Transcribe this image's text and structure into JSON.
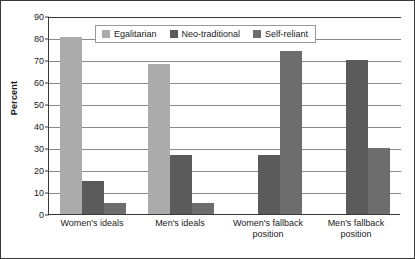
{
  "chart_data": {
    "type": "bar",
    "title": "",
    "xlabel": "",
    "ylabel": "Percent",
    "ylim": [
      0,
      90
    ],
    "yticks": [
      0,
      10,
      20,
      30,
      40,
      50,
      60,
      70,
      80,
      90
    ],
    "grid": true,
    "legend_position": "top-center-inside",
    "categories": [
      "Women's ideals",
      "Men's ideals",
      "Women's fallback position",
      "Men's fallback position"
    ],
    "category_lines": [
      [
        "Women's ideals"
      ],
      [
        "Men's ideals"
      ],
      [
        "Women's fallback",
        "position"
      ],
      [
        "Men's fallback",
        "position"
      ]
    ],
    "series": [
      {
        "name": "Egalitarian",
        "color": "#ababab",
        "values": [
          80.5,
          68,
          0,
          0
        ]
      },
      {
        "name": "Neo-traditional",
        "color": "#5a5a5a",
        "values": [
          15,
          27,
          27,
          70
        ]
      },
      {
        "name": "Self-reliant",
        "color": "#6d6d6d",
        "values": [
          5,
          5,
          74,
          30
        ]
      }
    ]
  }
}
